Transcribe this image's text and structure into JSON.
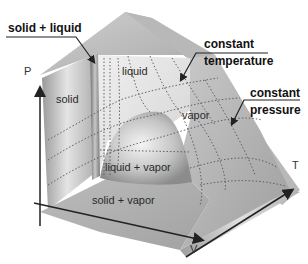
{
  "diagram": {
    "axes": {
      "p": "P",
      "t": "T",
      "v": "V"
    },
    "regions": {
      "solid": "solid",
      "liquid": "liquid",
      "vapor": "vapor",
      "liquid_vapor": "liquid + vapor",
      "solid_vapor": "solid + vapor"
    },
    "callouts": {
      "solid_liquid": "solid + liquid",
      "constant_temperature_1": "constant",
      "constant_temperature_2": "temperature",
      "constant_pressure_1": "constant",
      "constant_pressure_2": "pressure"
    },
    "colors": {
      "surface_light": "#e6e6e6",
      "surface_mid": "#bdbdbd",
      "surface_dark": "#8a8a8a",
      "grid_dots": "#555555",
      "axis": "#222222"
    }
  }
}
